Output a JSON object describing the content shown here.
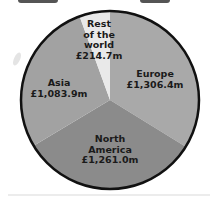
{
  "chart_data": {
    "type": "pie",
    "title": "",
    "unit": "£m",
    "start_angle_deg": 0,
    "direction": "clockwise",
    "slices": [
      {
        "name": "Europe",
        "value": 1306.4,
        "label_lines": [
          "Europe",
          "£1,306.4m"
        ],
        "color": "#a9a9a9"
      },
      {
        "name": "North America",
        "value": 1261.0,
        "label_lines": [
          "North",
          "America",
          "£1,261.0m"
        ],
        "color": "#8b8b8b"
      },
      {
        "name": "Asia",
        "value": 1083.9,
        "label_lines": [
          "Asia",
          "£1,083.9m"
        ],
        "color": "#a2a2a2"
      },
      {
        "name": "Rest of the world",
        "value": 214.7,
        "label_lines": [
          "Rest",
          "of the",
          "world",
          "£214.7m"
        ],
        "color": "#e9e9e9"
      }
    ],
    "total": 3866.0,
    "legend": "none (labels inside slices)"
  },
  "labels": {
    "europe": {
      "line1": "Europe",
      "line2": "£1,306.4m"
    },
    "north_america": {
      "line1": "North",
      "line2": "America",
      "line3": "£1,261.0m"
    },
    "asia": {
      "line1": "Asia",
      "line2": "£1,083.9m"
    },
    "rest": {
      "line1": "Rest",
      "line2": "of the",
      "line3": "world",
      "line4": "£214.7m"
    }
  }
}
